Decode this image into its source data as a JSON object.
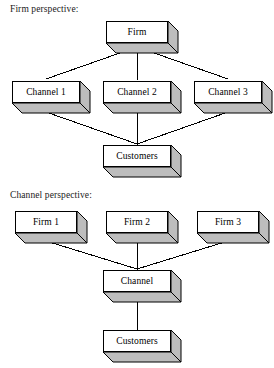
{
  "page": {
    "background_color": "#ffffff",
    "width": 274,
    "height": 368
  },
  "style": {
    "box_front_color": "#ffffff",
    "box_shade_color": "#bdbdbd",
    "line_color": "#000000",
    "text_color": "#000000"
  },
  "sections": [
    {
      "id": "firm-perspective",
      "title": "Firm perspective:",
      "nodes": {
        "root": "Firm",
        "middle": [
          "Channel 1",
          "Channel 2",
          "Channel 3"
        ],
        "leaf": "Customers"
      }
    },
    {
      "id": "channel-perspective",
      "title": "Channel perspective:",
      "nodes": {
        "root": [
          "Firm 1",
          "Firm 2",
          "Firm 3"
        ],
        "middle": "Channel",
        "leaf": "Customers"
      }
    }
  ],
  "diagram": {
    "type": "hierarchy",
    "top": {
      "heading": "Firm perspective:",
      "level1": "Firm",
      "level2_a": "Channel 1",
      "level2_b": "Channel 2",
      "level2_c": "Channel 3",
      "level3": "Customers"
    },
    "bottom": {
      "heading": "Channel perspective:",
      "level1_a": "Firm 1",
      "level1_b": "Firm 2",
      "level1_c": "Firm 3",
      "level2": "Channel",
      "level3": "Customers"
    }
  }
}
